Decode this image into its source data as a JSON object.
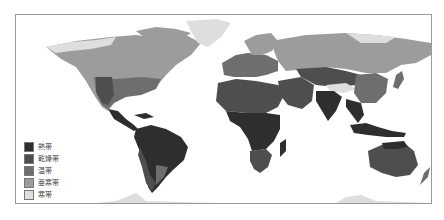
{
  "map": {
    "type": "world-climate-zones",
    "colors": {
      "tropical": "#2e2e2e",
      "arid": "#4e4e4e",
      "temperate": "#6e6e6e",
      "subarctic": "#9c9c9c",
      "polar": "#dedede",
      "ocean": "#ffffff",
      "border": "#9a9a9a"
    }
  },
  "legend": {
    "items": [
      {
        "label": "熱帯",
        "zone": "tropical",
        "color": "#2e2e2e"
      },
      {
        "label": "乾燥帯",
        "zone": "arid",
        "color": "#4e4e4e"
      },
      {
        "label": "温帯",
        "zone": "temperate",
        "color": "#6e6e6e"
      },
      {
        "label": "亜寒帯",
        "zone": "subarctic",
        "color": "#9c9c9c"
      },
      {
        "label": "寒帯",
        "zone": "polar",
        "color": "#dedede"
      }
    ]
  }
}
